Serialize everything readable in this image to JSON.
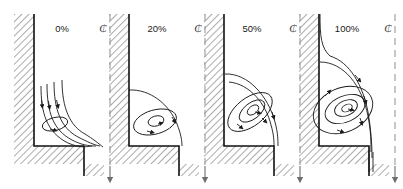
{
  "figure": {
    "type": "technical-line-diagram",
    "width": 403,
    "height": 189,
    "background_color": "#ffffff",
    "line_color": "#1a1a1a",
    "hatch_color": "#8a8a8a",
    "centerline_color": "#9a9a9a",
    "wall_edge_color": "#111111"
  },
  "panels": [
    {
      "id": "panel-0",
      "label": "0%",
      "label_x": 62,
      "label_y": 32,
      "origin_x": 0,
      "description": "Attached boundary-layer streamlines sweeping down the left wall and turning out over the step; one small elongated recirculation eddy near the lower left wall.",
      "vortex_count": 1,
      "vortex_kind": "small-corner-eddy",
      "has_through_flow": true
    },
    {
      "id": "panel-1",
      "label": "20%",
      "label_x": 157,
      "label_y": 32,
      "origin_x": 95,
      "description": "A single closed recirculation cell fills the lower corner with two nested streamlines; no through-flow streamlines reach the step.",
      "vortex_count": 2,
      "vortex_kind": "closed-recirculation",
      "has_through_flow": false
    },
    {
      "id": "panel-2",
      "label": "50%",
      "label_x": 252,
      "label_y": 32,
      "origin_x": 190,
      "description": "An enlarged recirculation zone with three nested closed streamlines spanning most of the cavity height.",
      "vortex_count": 3,
      "vortex_kind": "closed-recirculation",
      "has_through_flow": false
    },
    {
      "id": "panel-3",
      "label": "100%",
      "label_x": 347,
      "label_y": 32,
      "origin_x": 285,
      "description": "A fully developed vortex with four nested closed streamlines, fed by an inflow stream curving down the upper left wall and exiting downward past the step corner.",
      "vortex_count": 4,
      "vortex_kind": "closed-recirculation",
      "has_through_flow": true
    }
  ],
  "centerlines": [
    {
      "id": "centerline-0",
      "x": 110,
      "glyph": "centerline-symbol",
      "has_arrowhead": true
    },
    {
      "id": "centerline-1",
      "x": 205,
      "glyph": "centerline-symbol",
      "has_arrowhead": true
    },
    {
      "id": "centerline-2",
      "x": 300,
      "glyph": "centerline-symbol",
      "has_arrowhead": true
    },
    {
      "id": "centerline-3",
      "x": 395,
      "glyph": "centerline-symbol",
      "has_arrowhead": true
    }
  ],
  "centerline_symbol": {
    "name": "centerline-symbol",
    "character": "₵",
    "meaning": "centerline"
  },
  "geometry": {
    "wall_left_x": 14,
    "wall_thickness": 20,
    "wall_top_y": 14,
    "floor_y": 146,
    "floor_thickness": 18,
    "step_x": 84,
    "step_bottom_y": 176,
    "note": "Each panel is an L-shaped stepped corner: hatched vertical wall at left, hatched horizontal floor, dropping to a lower hatched step at the right."
  },
  "axis_labels": {
    "percent_suffix": "%"
  }
}
